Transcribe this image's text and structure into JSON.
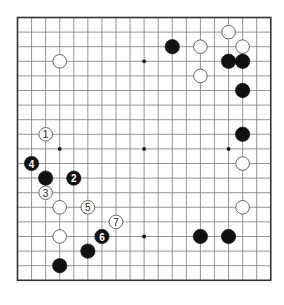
{
  "board": {
    "size": 19,
    "origin": {
      "x": 17.5,
      "y": 17.5
    },
    "spacing": {
      "x": 14.07,
      "y": 14.6
    },
    "line_color": "#7a7a7a",
    "border_color": "#333333",
    "background": "#ffffff",
    "star_points": [
      [
        3,
        3
      ],
      [
        9,
        3
      ],
      [
        15,
        3
      ],
      [
        3,
        9
      ],
      [
        9,
        9
      ],
      [
        15,
        9
      ],
      [
        3,
        15
      ],
      [
        9,
        15
      ],
      [
        15,
        15
      ]
    ]
  },
  "stones": [
    {
      "color": "white",
      "col": 3,
      "row": 3,
      "label": ""
    },
    {
      "color": "black",
      "col": 11,
      "row": 2,
      "label": ""
    },
    {
      "color": "white",
      "col": 13,
      "row": 2,
      "label": ""
    },
    {
      "color": "white",
      "col": 15,
      "row": 1,
      "label": ""
    },
    {
      "color": "white",
      "col": 16,
      "row": 2,
      "label": ""
    },
    {
      "color": "black",
      "col": 15,
      "row": 3,
      "label": ""
    },
    {
      "color": "black",
      "col": 16,
      "row": 3,
      "label": ""
    },
    {
      "color": "white",
      "col": 13,
      "row": 4,
      "label": ""
    },
    {
      "color": "black",
      "col": 16,
      "row": 5,
      "label": ""
    },
    {
      "color": "black",
      "col": 16,
      "row": 8,
      "label": ""
    },
    {
      "color": "white",
      "col": 16,
      "row": 10,
      "label": ""
    },
    {
      "color": "white",
      "col": 16,
      "row": 13,
      "label": ""
    },
    {
      "color": "black",
      "col": 13,
      "row": 15,
      "label": ""
    },
    {
      "color": "black",
      "col": 15,
      "row": 15,
      "label": ""
    },
    {
      "color": "white",
      "col": 2,
      "row": 8,
      "label": "1"
    },
    {
      "color": "black",
      "col": 4,
      "row": 11,
      "label": "2"
    },
    {
      "color": "white",
      "col": 2,
      "row": 12,
      "label": "3"
    },
    {
      "color": "black",
      "col": 1,
      "row": 10,
      "label": "4"
    },
    {
      "color": "white",
      "col": 5,
      "row": 13,
      "label": "5"
    },
    {
      "color": "black",
      "col": 6,
      "row": 15,
      "label": "6"
    },
    {
      "color": "white",
      "col": 7,
      "row": 14,
      "label": "7"
    },
    {
      "color": "black",
      "col": 2,
      "row": 11,
      "label": ""
    },
    {
      "color": "white",
      "col": 3,
      "row": 13,
      "label": ""
    },
    {
      "color": "white",
      "col": 3,
      "row": 15,
      "label": ""
    },
    {
      "color": "black",
      "col": 5,
      "row": 16,
      "label": ""
    },
    {
      "color": "black",
      "col": 3,
      "row": 17,
      "label": ""
    }
  ]
}
